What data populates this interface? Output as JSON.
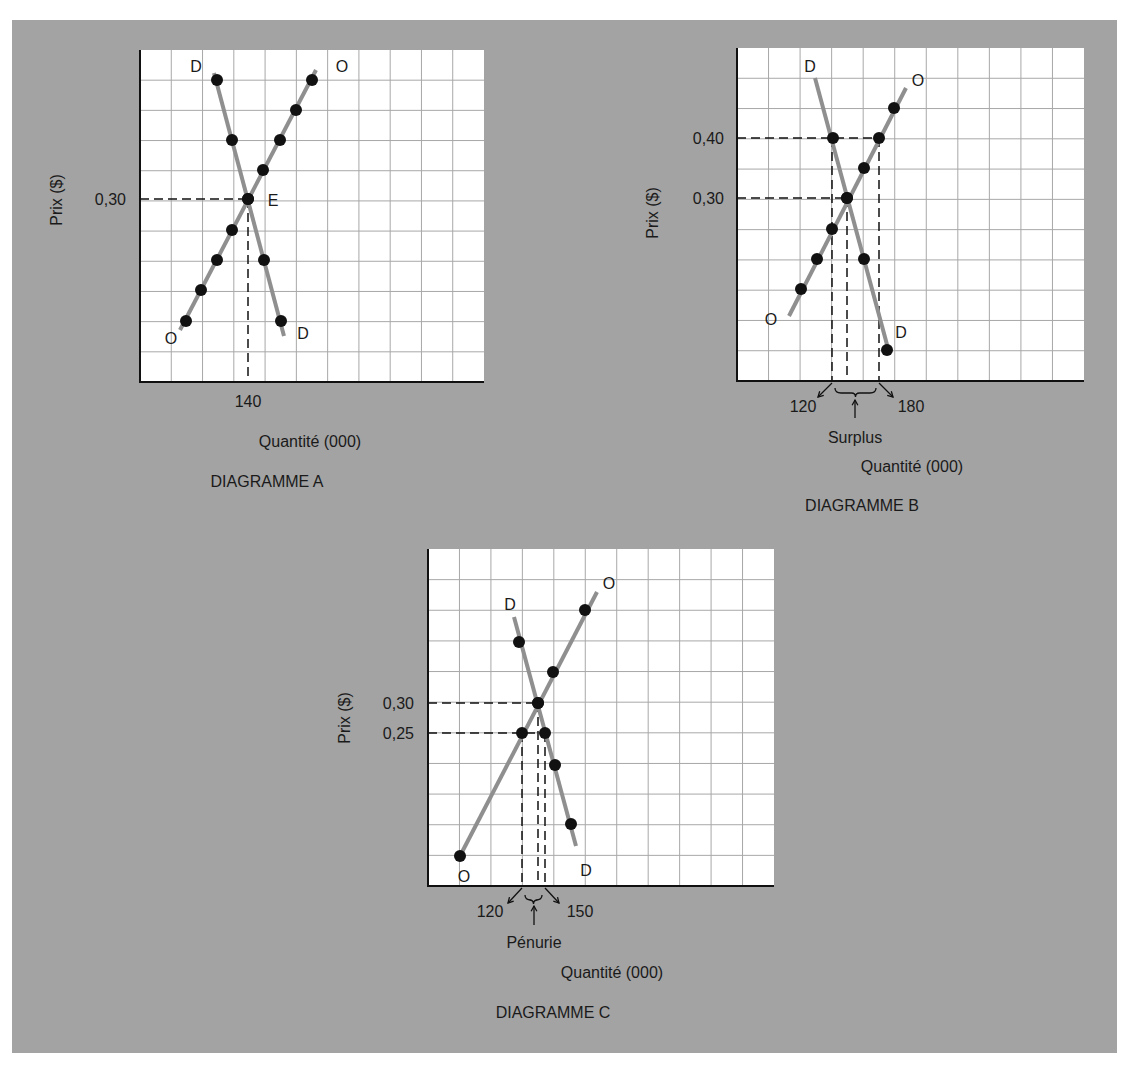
{
  "colors": {
    "background": "#a3a3a3",
    "grid_bg": "#ffffff",
    "grid_line": "#a8a8a8",
    "axis": "#111111",
    "curve": "#8f8f8f",
    "dot": "#111111",
    "dash": "#111111",
    "text": "#1a1a1a"
  },
  "diagrams": [
    {
      "id": "A",
      "title": "DIAGRAMME A",
      "xlabel": "Quantité (000)",
      "ylabel": "Prix ($)",
      "grid": {
        "x": 140,
        "y": 50,
        "w": 344,
        "h": 332,
        "cols": 11,
        "rows": 11
      },
      "price_ticks": [
        {
          "label": "0,30",
          "y": 199
        }
      ],
      "qty_ticks": [
        {
          "label": "140",
          "x": 248
        }
      ],
      "demand": {
        "line": [
          [
            214,
            73
          ],
          [
            284,
            336
          ]
        ],
        "points": [
          [
            217,
            80
          ],
          [
            232,
            140
          ],
          [
            248,
            199
          ],
          [
            264,
            260
          ],
          [
            281,
            321
          ]
        ],
        "label_start": {
          "text": "D",
          "x": 196,
          "y": 72
        },
        "label_end": {
          "text": "D",
          "x": 303,
          "y": 339
        }
      },
      "supply": {
        "line": [
          [
            180,
            330
          ],
          [
            316,
            70
          ]
        ],
        "points": [
          [
            186,
            321
          ],
          [
            201,
            290
          ],
          [
            217,
            260
          ],
          [
            232,
            230
          ],
          [
            248,
            199
          ],
          [
            263,
            170
          ],
          [
            280,
            140
          ],
          [
            296,
            110
          ],
          [
            312,
            80
          ]
        ],
        "label_start": {
          "text": "O",
          "x": 171,
          "y": 344
        },
        "label_end": {
          "text": "O",
          "x": 342,
          "y": 72
        }
      },
      "equilibrium_label": {
        "text": "E",
        "x": 273,
        "y": 206
      },
      "dashes": [
        {
          "x1": 140,
          "y1": 199,
          "x2": 248,
          "y2": 199
        },
        {
          "x1": 248,
          "y1": 199,
          "x2": 248,
          "y2": 382
        }
      ],
      "text_positions": {
        "ylabel": {
          "x": 62,
          "y": 200
        },
        "xlabel": {
          "x": 310,
          "y": 447
        },
        "title": {
          "x": 267,
          "y": 487
        },
        "price_tick_x": 126,
        "qty_tick_y": 407
      }
    },
    {
      "id": "B",
      "title": "DIAGRAMME B",
      "xlabel": "Quantité (000)",
      "ylabel": "Prix ($)",
      "grid": {
        "x": 737,
        "y": 48,
        "w": 347,
        "h": 333,
        "cols": 11,
        "rows": 11
      },
      "price_ticks": [
        {
          "label": "0,40",
          "y": 138
        },
        {
          "label": "0,30",
          "y": 198
        }
      ],
      "qty_ticks": [
        {
          "label": "120",
          "x": 803
        },
        {
          "label": "180",
          "x": 911
        }
      ],
      "demand": {
        "line": [
          [
            815,
            78
          ],
          [
            889,
            352
          ]
        ],
        "points": [
          [
            833,
            138
          ],
          [
            847,
            198
          ],
          [
            864,
            259
          ],
          [
            887,
            350
          ]
        ],
        "label_start": {
          "text": "D",
          "x": 810,
          "y": 72
        },
        "label_end": {
          "text": "D",
          "x": 901,
          "y": 338
        }
      },
      "supply": {
        "line": [
          [
            789,
            316
          ],
          [
            906,
            88
          ]
        ],
        "points": [
          [
            801,
            289
          ],
          [
            817,
            259
          ],
          [
            832,
            229
          ],
          [
            847,
            198
          ],
          [
            864,
            168
          ],
          [
            879,
            138
          ],
          [
            894,
            108
          ]
        ],
        "label_start": {
          "text": "O",
          "x": 771,
          "y": 325
        },
        "label_end": {
          "text": "O",
          "x": 918,
          "y": 86
        }
      },
      "equilibrium_label": null,
      "dashes": [
        {
          "x1": 737,
          "y1": 138,
          "x2": 879,
          "y2": 138
        },
        {
          "x1": 737,
          "y1": 198,
          "x2": 847,
          "y2": 198
        },
        {
          "x1": 832,
          "y1": 138,
          "x2": 832,
          "y2": 381
        },
        {
          "x1": 847,
          "y1": 198,
          "x2": 847,
          "y2": 375
        },
        {
          "x1": 879,
          "y1": 138,
          "x2": 879,
          "y2": 381
        }
      ],
      "annotation": {
        "text": "Surplus",
        "brace": {
          "x1": 832,
          "x2": 879,
          "y": 393
        },
        "arrow_left": {
          "from": [
            832,
            383
          ],
          "to": [
            818,
            397
          ]
        },
        "arrow_right": {
          "from": [
            879,
            383
          ],
          "to": [
            893,
            397
          ]
        },
        "up_arrow": {
          "x": 855,
          "y1": 418,
          "y2": 400
        },
        "text_pos": {
          "x": 855,
          "y": 443
        }
      },
      "text_positions": {
        "ylabel": {
          "x": 658,
          "y": 213
        },
        "xlabel": {
          "x": 912,
          "y": 472
        },
        "title": {
          "x": 862,
          "y": 511
        },
        "price_tick_x": 724,
        "qty_tick_y": 412
      }
    },
    {
      "id": "C",
      "title": "DIAGRAMME C",
      "xlabel": "Quantité (000)",
      "ylabel": "Prix ($)",
      "grid": {
        "x": 428,
        "y": 549,
        "w": 346,
        "h": 337,
        "cols": 11,
        "rows": 11
      },
      "price_ticks": [
        {
          "label": "0,30",
          "y": 703
        },
        {
          "label": "0,25",
          "y": 733
        }
      ],
      "qty_ticks": [
        {
          "label": "120",
          "x": 490
        },
        {
          "label": "150",
          "x": 580
        }
      ],
      "demand": {
        "line": [
          [
            514,
            617
          ],
          [
            576,
            846
          ]
        ],
        "points": [
          [
            519,
            642
          ],
          [
            538,
            703
          ],
          [
            545,
            733
          ],
          [
            555,
            765
          ],
          [
            571,
            824
          ]
        ],
        "label_start": {
          "text": "D",
          "x": 510,
          "y": 610
        },
        "label_end": {
          "text": "D",
          "x": 586,
          "y": 876
        }
      },
      "supply": {
        "line": [
          [
            460,
            856
          ],
          [
            597,
            592
          ]
        ],
        "points": [
          [
            460,
            856
          ],
          [
            522,
            733
          ],
          [
            538,
            703
          ],
          [
            553,
            672
          ],
          [
            585,
            610
          ]
        ],
        "label_start": {
          "text": "O",
          "x": 464,
          "y": 882
        },
        "label_end": {
          "text": "O",
          "x": 609,
          "y": 589
        }
      },
      "equilibrium_label": null,
      "dashes": [
        {
          "x1": 428,
          "y1": 703,
          "x2": 538,
          "y2": 703
        },
        {
          "x1": 428,
          "y1": 733,
          "x2": 545,
          "y2": 733
        },
        {
          "x1": 522,
          "y1": 733,
          "x2": 522,
          "y2": 886
        },
        {
          "x1": 538,
          "y1": 703,
          "x2": 538,
          "y2": 880
        },
        {
          "x1": 545,
          "y1": 733,
          "x2": 545,
          "y2": 886
        }
      ],
      "annotation": {
        "text": "Pénurie",
        "brace": {
          "x1": 522,
          "x2": 545,
          "y": 900
        },
        "arrow_left": {
          "from": [
            522,
            888
          ],
          "to": [
            508,
            903
          ]
        },
        "arrow_right": {
          "from": [
            545,
            888
          ],
          "to": [
            559,
            903
          ]
        },
        "up_arrow": {
          "x": 534,
          "y1": 925,
          "y2": 906
        },
        "text_pos": {
          "x": 534,
          "y": 948
        }
      },
      "text_positions": {
        "ylabel": {
          "x": 350,
          "y": 718
        },
        "xlabel": {
          "x": 612,
          "y": 978
        },
        "title": {
          "x": 553,
          "y": 1018
        },
        "price_tick_x": 414,
        "qty_tick_y": 917
      }
    }
  ]
}
